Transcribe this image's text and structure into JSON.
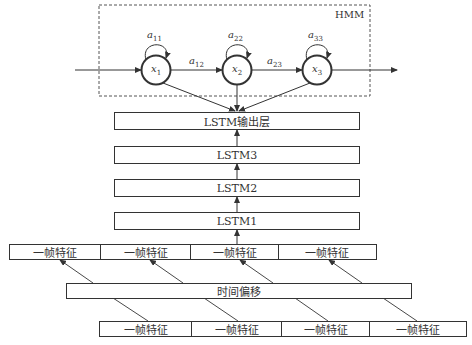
{
  "hmm": {
    "label": "HMM",
    "states": [
      {
        "name": "x",
        "sub": "1"
      },
      {
        "name": "x",
        "sub": "2"
      },
      {
        "name": "x",
        "sub": "3"
      }
    ],
    "self_transitions": [
      {
        "name": "a",
        "sub": "11"
      },
      {
        "name": "a",
        "sub": "22"
      },
      {
        "name": "a",
        "sub": "33"
      }
    ],
    "transitions": [
      {
        "name": "a",
        "sub": "12"
      },
      {
        "name": "a",
        "sub": "23"
      }
    ]
  },
  "lstm_layers": {
    "output": "LSTM输出层",
    "layer3": "LSTM3",
    "layer2": "LSTM2",
    "layer1": "LSTM1"
  },
  "time_shift": {
    "label": "时间偏移"
  },
  "frames_top": [
    "一帧特征",
    "一帧特征",
    "一帧特征",
    "一帧特征"
  ],
  "frames_bottom": [
    "一帧特征",
    "一帧特征",
    "一帧特征",
    "一帧特征"
  ],
  "colors": {
    "stroke": "#333333",
    "background": "#ffffff"
  }
}
